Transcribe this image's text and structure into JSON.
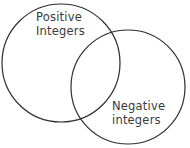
{
  "diagram": {
    "type": "venn",
    "stroke_color": "#2e2e2e",
    "sets": [
      {
        "id": "positive",
        "label_line1": "Positive",
        "label_line2": "Integers",
        "circle": {
          "cx": 61,
          "cy": 63,
          "r": 59
        }
      },
      {
        "id": "negative",
        "label_line1": "Negative",
        "label_line2": "integers",
        "circle": {
          "cx": 128,
          "cy": 87,
          "r": 57
        }
      }
    ]
  }
}
